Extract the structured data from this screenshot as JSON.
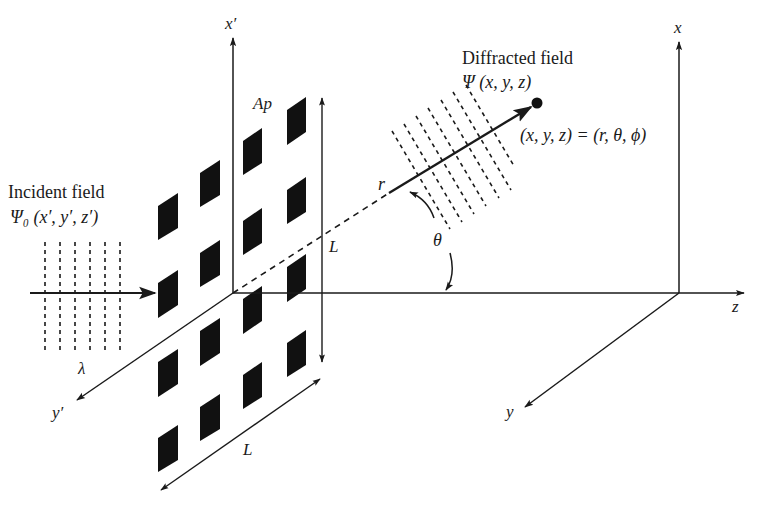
{
  "figure": {
    "type": "diffraction-geometry-diagram",
    "incident": {
      "title": "Incident field",
      "expr": "Ψ₀ (x′, y′, z′)",
      "wavelength_label": "λ",
      "wave_lines_x": [
        45,
        60,
        75,
        90,
        105,
        120
      ]
    },
    "diffracted": {
      "title": "Diffracted field",
      "expr": "Ψ (x, y, z)",
      "point_label": "(x, y, z) = (r, θ, ϕ)",
      "r_label": "r",
      "theta_label": "θ"
    },
    "aperture": {
      "label": "Ap",
      "size_label_vertical": "L",
      "size_label_horizontal": "L",
      "grid": {
        "columns": 4,
        "rows": 4,
        "col_x": [
          158,
          200,
          243,
          287
        ],
        "col_top_y": [
          [
            206,
            283,
            362,
            438
          ],
          [
            173,
            253,
            331,
            407
          ],
          [
            141,
            221,
            299,
            375
          ],
          [
            110,
            190,
            267,
            343
          ]
        ]
      }
    },
    "source_axes": {
      "x": "x′",
      "y": "y′"
    },
    "observer_axes": {
      "x": "x",
      "y": "y",
      "z": "z"
    },
    "colors": {
      "ink": "#1a1a1a",
      "background": "#ffffff"
    }
  }
}
